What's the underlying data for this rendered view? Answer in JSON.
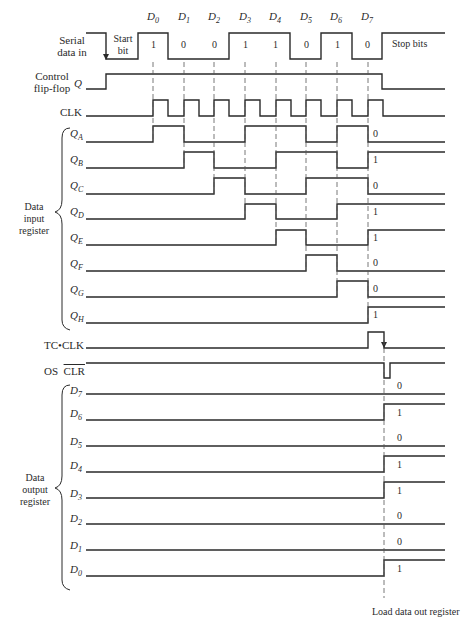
{
  "diagram": {
    "type": "timing-diagram",
    "title": "",
    "clock_edges_x": [
      153,
      184,
      214,
      245,
      276,
      306,
      337,
      368
    ],
    "load_edge_x": 384
  },
  "top_labels": {
    "bits": [
      "D0",
      "D1",
      "D2",
      "D3",
      "D4",
      "D5",
      "D6",
      "D7"
    ],
    "bit_values": [
      "1",
      "0",
      "0",
      "1",
      "1",
      "0",
      "1",
      "0"
    ],
    "start_bit_line1": "Start",
    "start_bit_line2": "bit",
    "stop_bits": "Stop bits"
  },
  "signals": {
    "serial_line1": "Serial",
    "serial_line2": "data in",
    "control_line1": "Control",
    "control_line2": "flip-flop",
    "control_q": "Q",
    "clk": "CLK",
    "tc_clk": "TC•CLK",
    "os": "OS",
    "clr": "CLR"
  },
  "input_register": {
    "label_line1": "Data",
    "label_line2": "input",
    "label_line3": "register",
    "rows": [
      {
        "name": "Q",
        "sub": "A",
        "final": "0"
      },
      {
        "name": "Q",
        "sub": "B",
        "final": "1"
      },
      {
        "name": "Q",
        "sub": "C",
        "final": "0"
      },
      {
        "name": "Q",
        "sub": "D",
        "final": "1"
      },
      {
        "name": "Q",
        "sub": "E",
        "final": "1"
      },
      {
        "name": "Q",
        "sub": "F",
        "final": "0"
      },
      {
        "name": "Q",
        "sub": "G",
        "final": "0"
      },
      {
        "name": "Q",
        "sub": "H",
        "final": "1"
      }
    ]
  },
  "output_register": {
    "label_line1": "Data",
    "label_line2": "output",
    "label_line3": "register",
    "rows": [
      {
        "name": "D",
        "sub": "7",
        "final": "0"
      },
      {
        "name": "D",
        "sub": "6",
        "final": "1"
      },
      {
        "name": "D",
        "sub": "5",
        "final": "0"
      },
      {
        "name": "D",
        "sub": "4",
        "final": "1"
      },
      {
        "name": "D",
        "sub": "3",
        "final": "1"
      },
      {
        "name": "D",
        "sub": "2",
        "final": "0"
      },
      {
        "name": "D",
        "sub": "1",
        "final": "0"
      },
      {
        "name": "D",
        "sub": "0",
        "final": "1"
      }
    ]
  },
  "footer": {
    "load_label": "Load data out register"
  },
  "colors": {
    "line": "#2a2a2a",
    "dash": "#555555",
    "background": "#ffffff"
  }
}
